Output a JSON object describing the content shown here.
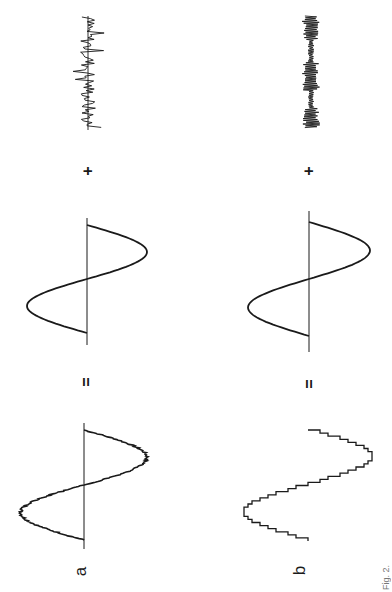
{
  "figure": {
    "orientation": "rotated-90-ccw",
    "rows": [
      {
        "label": "a",
        "description": "noisy sine = sine + noise",
        "equals_symbol": "=",
        "plus_symbol": "+",
        "components": [
          "sine-with-small-noise",
          "pure-sine",
          "random-noise"
        ]
      },
      {
        "label": "b",
        "description": "quantized (staircase) sine = sine + quantization error",
        "equals_symbol": "=",
        "plus_symbol": "+",
        "components": [
          "staircase-sine",
          "pure-sine",
          "quantization-error"
        ]
      }
    ],
    "caption_partial": "Fig. 2."
  },
  "colors": {
    "ink": "#1a1a1a",
    "background": "#ffffff"
  }
}
